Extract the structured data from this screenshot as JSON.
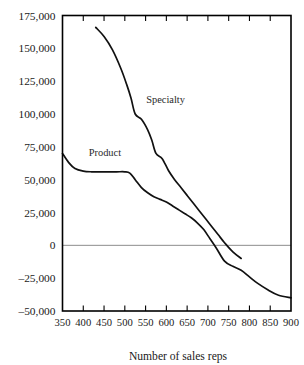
{
  "chart_data": {
    "type": "line",
    "title": "",
    "xlabel": "Number of sales reps",
    "ylabel": "",
    "xlim": [
      350,
      900
    ],
    "ylim": [
      -50000,
      175000
    ],
    "grid": false,
    "legend_position": "inline-annotation",
    "zero_reference_line": true,
    "x_ticks": [
      350,
      400,
      450,
      500,
      550,
      600,
      650,
      700,
      750,
      800,
      850,
      900
    ],
    "x_tick_labels": [
      "350",
      "400",
      "450",
      "500",
      "550",
      "600",
      "650",
      "700",
      "750",
      "800",
      "850",
      "900"
    ],
    "y_ticks": [
      -50000,
      -25000,
      0,
      25000,
      50000,
      75000,
      100000,
      125000,
      150000,
      175000
    ],
    "y_tick_labels": [
      "–50,000",
      "–25,000",
      "0",
      "25,000",
      "50,000",
      "75,000",
      "100,000",
      "125,000",
      "150,000",
      "175,000"
    ],
    "annotations": [
      {
        "text": "Specialty",
        "x": 598,
        "y": 108000
      },
      {
        "text": "Product",
        "x": 452,
        "y": 68000
      }
    ],
    "series": [
      {
        "name": "Specialty",
        "x": [
          430,
          450,
          470,
          490,
          505,
          515,
          525,
          540,
          555,
          565,
          575,
          590,
          605,
          620,
          635,
          650,
          665,
          680,
          695,
          710,
          725,
          740,
          760,
          780
        ],
        "y": [
          166000,
          159000,
          149000,
          135000,
          122000,
          112000,
          100000,
          96000,
          88000,
          80000,
          70000,
          66000,
          57000,
          50000,
          44000,
          38000,
          32000,
          26000,
          20000,
          14000,
          8000,
          2000,
          -5000,
          -10000
        ]
      },
      {
        "name": "Product",
        "x": [
          350,
          365,
          380,
          400,
          420,
          450,
          480,
          500,
          512,
          525,
          540,
          555,
          570,
          585,
          600,
          615,
          630,
          645,
          660,
          675,
          690,
          705,
          720,
          740,
          760,
          780,
          800,
          820,
          845,
          870,
          900
        ],
        "y": [
          70000,
          63000,
          58500,
          56500,
          56000,
          56000,
          56000,
          56000,
          55000,
          50000,
          44000,
          40000,
          37000,
          35000,
          33000,
          30000,
          27000,
          24000,
          21000,
          17000,
          12000,
          5000,
          -2000,
          -12000,
          -16000,
          -19000,
          -24000,
          -29000,
          -34000,
          -38000,
          -40000
        ]
      }
    ]
  },
  "figure": {
    "xaxis_title": "Number of sales reps"
  }
}
